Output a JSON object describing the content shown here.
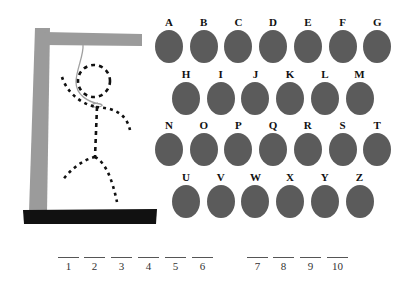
{
  "game": {
    "title": "Hangman",
    "letter_color": "#5b5b5b",
    "gallows_color": "#9b9b9b",
    "base_color": "#111111"
  },
  "keyboard": {
    "rows": [
      {
        "offset_x": 154,
        "top": 16,
        "letters": [
          "A",
          "B",
          "C",
          "D",
          "E",
          "F",
          "G"
        ]
      },
      {
        "offset_x": 171,
        "top": 68,
        "letters": [
          "H",
          "I",
          "J",
          "K",
          "L",
          "M"
        ]
      },
      {
        "offset_x": 154,
        "top": 119,
        "letters": [
          "N",
          "O",
          "P",
          "Q",
          "R",
          "S",
          "T"
        ]
      },
      {
        "offset_x": 171,
        "top": 171,
        "letters": [
          "U",
          "V",
          "W",
          "X",
          "Y",
          "Z"
        ]
      }
    ],
    "spacing": 34.7
  },
  "word": {
    "blanks": [
      {
        "label": "1",
        "x": 58
      },
      {
        "label": "2",
        "x": 84
      },
      {
        "label": "3",
        "x": 111
      },
      {
        "label": "4",
        "x": 138
      },
      {
        "label": "5",
        "x": 165
      },
      {
        "label": "6",
        "x": 192
      },
      {
        "label": "7",
        "x": 247
      },
      {
        "label": "8",
        "x": 273
      },
      {
        "label": "9",
        "x": 300
      },
      {
        "label": "10",
        "x": 327
      }
    ],
    "line_y": 257
  }
}
